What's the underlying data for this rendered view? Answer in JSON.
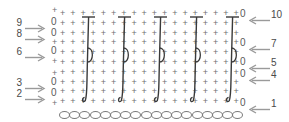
{
  "diagram": {
    "type": "crochet-pattern-chart",
    "background_color": "#ffffff",
    "symbol_color": "#6f6f6f",
    "stitch_color": "#3a3a3a",
    "label_color": "#4a4a4a"
  },
  "left_labels": [
    {
      "number": "9",
      "arrow": "right-arrow",
      "y": 18
    },
    {
      "number": "8",
      "arrow": "right-arrow",
      "y": 29
    },
    {
      "number": "6",
      "arrow": "right-arrow",
      "y": 47
    },
    {
      "number": "3",
      "arrow": "right-arrow",
      "y": 78
    },
    {
      "number": "2",
      "arrow": "right-arrow",
      "y": 89
    }
  ],
  "right_labels": [
    {
      "number": "10",
      "arrow": "left-arrow",
      "y": 10
    },
    {
      "number": "7",
      "arrow": "left-arrow",
      "y": 39
    },
    {
      "number": "5",
      "arrow": "left-arrow",
      "y": 58
    },
    {
      "number": "4",
      "arrow": "left-arrow",
      "y": 70
    },
    {
      "number": "1",
      "arrow": "left-arrow",
      "y": 99
    }
  ],
  "left_zeros": [
    {
      "y": 17
    },
    {
      "y": 28
    },
    {
      "y": 46
    },
    {
      "y": 77
    },
    {
      "y": 88
    }
  ],
  "right_zeros": [
    {
      "y": 9
    },
    {
      "y": 38
    },
    {
      "y": 57
    },
    {
      "y": 69
    },
    {
      "y": 98
    }
  ],
  "symbols": {
    "single_crochet": "+",
    "chain": "o",
    "turning_chain": "0"
  },
  "grid": {
    "columns": 18,
    "rows": 10,
    "col_start_x": 60,
    "col_step": 10.2,
    "row_start_y": 9,
    "row_step": 9.8
  },
  "chain_row": {
    "count": 18,
    "y": 111,
    "start_x": 59,
    "step": 10.2
  },
  "stitch_columns": [
    {
      "x": 88
    },
    {
      "x": 124
    },
    {
      "x": 160
    },
    {
      "x": 196
    },
    {
      "x": 232
    }
  ]
}
